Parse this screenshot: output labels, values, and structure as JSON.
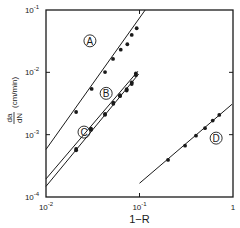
{
  "chart_data": {
    "type": "scatter",
    "title": "",
    "xlabel": "1−R",
    "ylabel": "da/dN (cm/min)",
    "ylabel_fraction": {
      "numerator": "da",
      "denominator": "dN",
      "units": "(cm/min)"
    },
    "xscale": "log",
    "yscale": "log",
    "xlim": [
      0.01,
      1
    ],
    "ylim": [
      0.0001,
      0.1
    ],
    "grid": false,
    "legend": "none; series labeled inline with circled letters",
    "x_ticks": [
      {
        "value": 0.01,
        "label": "10",
        "exp": "-2"
      },
      {
        "value": 0.1,
        "label": "10",
        "exp": "-1"
      },
      {
        "value": 1,
        "label": "1",
        "exp": ""
      }
    ],
    "y_ticks": [
      {
        "value": 0.0001,
        "label": "10",
        "exp": "-4"
      },
      {
        "value": 0.001,
        "label": "10",
        "exp": "-3"
      },
      {
        "value": 0.01,
        "label": "10",
        "exp": "-2"
      },
      {
        "value": 0.1,
        "label": "10",
        "exp": "-1"
      }
    ],
    "series": [
      {
        "name": "A",
        "label_pos": {
          "x": 0.0295,
          "y": 0.032
        },
        "line": {
          "x": [
            0.01,
            0.115
          ],
          "y": [
            0.00058,
            0.1
          ]
        },
        "points": {
          "x": [
            0.021,
            0.0308,
            0.0428,
            0.0521,
            0.063,
            0.0741,
            0.0826,
            0.0933
          ],
          "y": [
            0.00231,
            0.00542,
            0.0101,
            0.0164,
            0.0231,
            0.0282,
            0.0398,
            0.051
          ]
        }
      },
      {
        "name": "B",
        "label_pos": {
          "x": 0.044,
          "y": 0.0046
        },
        "line": {
          "x": [
            0.01,
            0.096
          ],
          "y": [
            0.000195,
            0.0104
          ]
        },
        "points": {
          "x": [
            0.021,
            0.0303,
            0.0428,
            0.0525,
            0.0619,
            0.0729,
            0.0826,
            0.0915
          ],
          "y": [
            0.00059,
            0.00125,
            0.00215,
            0.00325,
            0.0043,
            0.00535,
            0.0069,
            0.0096
          ]
        }
      },
      {
        "name": "C",
        "label_pos": {
          "x": 0.0255,
          "y": 0.0011
        },
        "line": {
          "x": [
            0.01,
            0.098
          ],
          "y": [
            0.000148,
            0.0094
          ]
        },
        "points": {
          "x": [
            0.021,
            0.0303,
            0.0428,
            0.0525,
            0.0619,
            0.0729,
            0.0826,
            0.0915
          ],
          "y": [
            0.00056,
            0.0012,
            0.00208,
            0.00312,
            0.00415,
            0.0051,
            0.0065,
            0.009
          ]
        }
      },
      {
        "name": "D",
        "label_pos": {
          "x": 0.66,
          "y": 0.00088
        },
        "line": {
          "x": [
            0.1,
            0.975
          ],
          "y": [
            0.000166,
            0.00307
          ]
        },
        "points": {
          "x": [
            0.202,
            0.307,
            0.402,
            0.502,
            0.607,
            0.713
          ],
          "y": [
            0.000393,
            0.000665,
            0.000964,
            0.00127,
            0.00168,
            0.00207
          ]
        }
      }
    ]
  },
  "style": {
    "ink_color": "#1a1a1a",
    "background": "#ffffff"
  }
}
